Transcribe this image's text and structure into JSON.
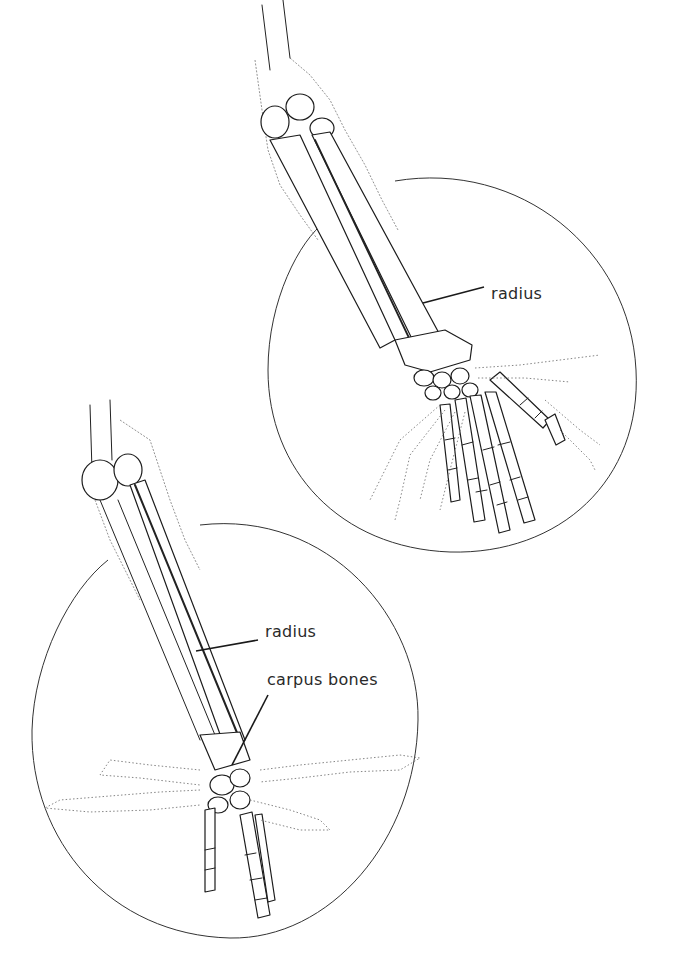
{
  "figure": {
    "panels": [
      {
        "id": "top",
        "description": "Forearm and hand skeleton, palm down (pronated), with dotted ghost of rotated hand",
        "labels": [
          {
            "text": "radius"
          }
        ]
      },
      {
        "id": "bottom",
        "description": "Forearm and hand skeleton, side view, with dotted ghost positions of hand showing wrist flexion",
        "labels": [
          {
            "text": "radius"
          },
          {
            "text": "carpus bones"
          }
        ]
      }
    ]
  }
}
